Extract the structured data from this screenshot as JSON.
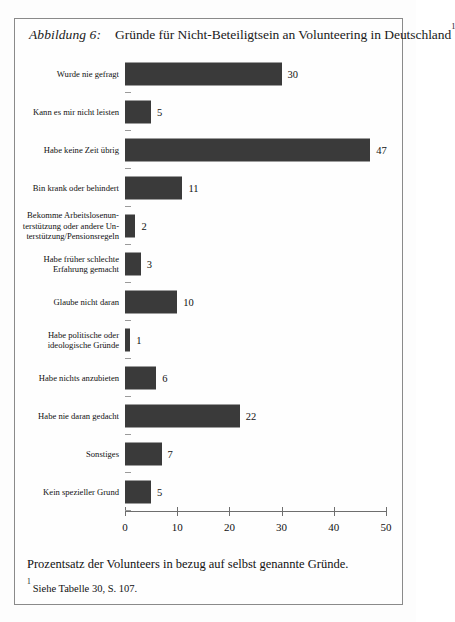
{
  "figure": {
    "label": "Abbildung 6:",
    "title": "Gründe für Nicht-Beteiligtsein an Volunteering in Deutschland",
    "title_superscript": "1",
    "caption": "Prozentsatz der Volunteers in bezug auf selbst genannte Gründe.",
    "footnote_superscript": "1",
    "footnote": "Siehe Tabelle 30, S. 107."
  },
  "chart_data": {
    "type": "bar",
    "orientation": "horizontal",
    "title": "Gründe für Nicht-Beteiligtsein an Volunteering in Deutschland",
    "xlabel": "",
    "ylabel": "",
    "xlim": [
      0,
      50
    ],
    "xticks": [
      0,
      10,
      20,
      30,
      40,
      50
    ],
    "xtick_labels": [
      "0",
      "10",
      "20",
      "30",
      "40",
      "50"
    ],
    "grid": false,
    "legend": null,
    "bar_color": "#3a3a3a",
    "categories": [
      "Wurde nie gefragt",
      "Kann es mir nicht leisten",
      "Habe keine Zeit übrig",
      "Bin krank oder behindert",
      "Bekomme Arbeitslosenunterstützung oder andere Unterstützung/Pensionsregeln",
      "Habe früher schlechte Erfahrung gemacht",
      "Glaube nicht daran",
      "Habe politische oder ideologische Gründe",
      "Habe nichts anzubieten",
      "Habe nie daran gedacht",
      "Sonstiges",
      "Kein spezieller Grund"
    ],
    "values": [
      30,
      5,
      47,
      11,
      2,
      3,
      10,
      1,
      6,
      22,
      7,
      5
    ],
    "data_labels": [
      "30",
      "5",
      "47",
      "11",
      "2",
      "3",
      "10",
      "1",
      "6",
      "22",
      "7",
      "5"
    ]
  },
  "rows": [
    {
      "lines": [
        "Wurde nie gefragt"
      ],
      "value": 30,
      "label": "30"
    },
    {
      "lines": [
        "Kann es mir nicht leisten"
      ],
      "value": 5,
      "label": "5"
    },
    {
      "lines": [
        "Habe keine Zeit übrig"
      ],
      "value": 47,
      "label": "47"
    },
    {
      "lines": [
        "Bin krank oder behindert"
      ],
      "value": 11,
      "label": "11"
    },
    {
      "lines": [
        "Bekomme Arbeitslosenun-",
        "terstützung oder andere Un-",
        "terstützung/Pensionsregeln"
      ],
      "value": 2,
      "label": "2"
    },
    {
      "lines": [
        "Habe früher schlechte",
        "Erfahrung gemacht"
      ],
      "value": 3,
      "label": "3"
    },
    {
      "lines": [
        "Glaube nicht daran"
      ],
      "value": 10,
      "label": "10"
    },
    {
      "lines": [
        "Habe politische oder",
        "ideologische Gründe"
      ],
      "value": 1,
      "label": "1"
    },
    {
      "lines": [
        "Habe nichts anzubieten"
      ],
      "value": 6,
      "label": "6"
    },
    {
      "lines": [
        "Habe nie daran gedacht"
      ],
      "value": 22,
      "label": "22"
    },
    {
      "lines": [
        "Sonstiges"
      ],
      "value": 7,
      "label": "7"
    },
    {
      "lines": [
        "Kein spezieller Grund"
      ],
      "value": 5,
      "label": "5"
    }
  ]
}
